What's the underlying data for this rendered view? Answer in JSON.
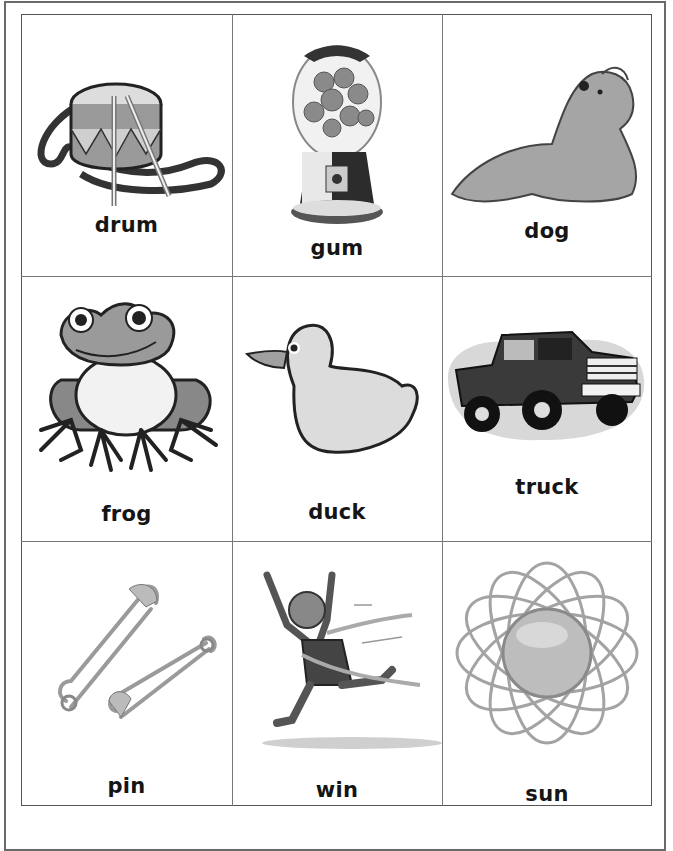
{
  "worksheet": {
    "cards": [
      {
        "word": "drum",
        "icon": "drum-icon"
      },
      {
        "word": "gum",
        "icon": "gumball-machine-icon"
      },
      {
        "word": "dog",
        "icon": "dog-icon"
      },
      {
        "word": "frog",
        "icon": "frog-icon"
      },
      {
        "word": "duck",
        "icon": "duck-icon"
      },
      {
        "word": "truck",
        "icon": "truck-icon"
      },
      {
        "word": "pin",
        "icon": "safety-pin-icon"
      },
      {
        "word": "win",
        "icon": "runner-winning-icon"
      },
      {
        "word": "sun",
        "icon": "sun-icon"
      }
    ],
    "grid": {
      "rows": 3,
      "columns": 3
    }
  }
}
